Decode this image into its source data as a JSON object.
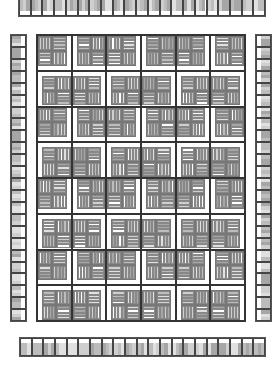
{
  "diagram": {
    "type": "quilt-layout",
    "palette": [
      "#a6a6a6",
      "#bcbcbc",
      "#cfcfcf",
      "#e0e0e0",
      "#ffffff",
      "#989898"
    ],
    "grid": {
      "columns": 6,
      "rows": 8
    },
    "borders": {
      "top": {
        "segments": 21
      },
      "bottom": {
        "segments": 21
      },
      "left": {
        "segments": 24
      },
      "right": {
        "segments": 24
      }
    },
    "blocks_pattern": [
      [
        "vhhv",
        "hvvh",
        "vhhv",
        "hvvh",
        "vhhv",
        "hvvh"
      ],
      [
        "hvvh",
        "vhhv",
        "hvvh",
        "vhhv",
        "hvvh",
        "vhhv"
      ],
      [
        "vhhv",
        "hvvh",
        "vhhv",
        "hvvh",
        "vhhv",
        "hvvh"
      ],
      [
        "hvvh",
        "vhhv",
        "hvvh",
        "vhhv",
        "hvvh",
        "vhhv"
      ],
      [
        "vhhv",
        "hvvh",
        "vhhv",
        "hvvh",
        "vhhv",
        "hvvh"
      ],
      [
        "hvvh",
        "vhhv",
        "hvvh",
        "vhhv",
        "hvvh",
        "vhhv"
      ],
      [
        "vhhv",
        "hvvh",
        "vhhv",
        "hvvh",
        "vhhv",
        "hvvh"
      ],
      [
        "hvvh",
        "vhhv",
        "hvvh",
        "vhhv",
        "hvvh",
        "vhhv"
      ]
    ]
  }
}
